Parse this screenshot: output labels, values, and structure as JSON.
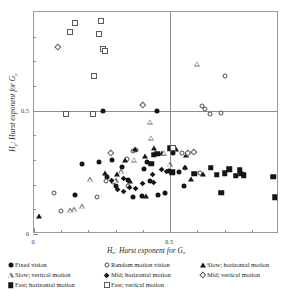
{
  "chart": {
    "type": "scatter",
    "title": "",
    "xlabel": "H_x: Hurst exponent for G_x",
    "xlabel_parts": {
      "sym": "H",
      "sub1": "x",
      "mid": ": Hurst exponent for ",
      "sym2": "G",
      "sub2": "x"
    },
    "ylabel": "H_y: Hurst exponent for G_y",
    "ylabel_parts": {
      "sym": "H",
      "sub1": "y",
      "mid": ": Hurst exponent for ",
      "sym2": "G",
      "sub2": "y"
    },
    "xlim": [
      0,
      0.9
    ],
    "ylim": [
      0,
      0.9
    ],
    "xticks_labeled": [
      {
        "value": 0,
        "label": "0"
      },
      {
        "value": 0.5,
        "label": "0.5"
      }
    ],
    "yticks_labeled": [
      {
        "value": 0,
        "label": "0"
      },
      {
        "value": 0.5,
        "label": "0.5"
      }
    ],
    "xticks_minor": [
      0.1,
      0.2,
      0.3,
      0.4,
      0.6,
      0.7,
      0.8
    ],
    "yticks_minor": [
      0.1,
      0.2,
      0.3,
      0.4,
      0.6,
      0.7,
      0.8
    ],
    "gridlines": {
      "x": [
        0.5
      ],
      "y": [
        0.5
      ]
    },
    "grid": "reference-lines-at-0.5-only",
    "legend_position": "below-axes",
    "frame": true
  },
  "chart_data": {
    "type": "scatter",
    "title": "",
    "xlabel": "Hx: Hurst exponent for Gx",
    "ylabel": "Hy: Hurst exponent for Gy",
    "xlim": [
      0,
      0.9
    ],
    "ylim": [
      0,
      0.9
    ],
    "series": [
      {
        "name": "Fixed vision",
        "marker": "circle-filled",
        "color": "#151515",
        "points": [
          [
            0.255,
            0.5
          ],
          [
            0.45,
            0.498
          ],
          [
            0.175,
            0.285
          ],
          [
            0.237,
            0.29
          ],
          [
            0.285,
            0.3
          ],
          [
            0.322,
            0.272
          ],
          [
            0.268,
            0.232
          ],
          [
            0.3,
            0.195
          ],
          [
            0.345,
            0.218
          ],
          [
            0.403,
            0.262
          ],
          [
            0.415,
            0.292
          ],
          [
            0.425,
            0.213
          ],
          [
            0.48,
            0.168
          ],
          [
            0.512,
            0.327
          ],
          [
            0.552,
            0.195
          ],
          [
            0.497,
            0.255
          ],
          [
            0.152,
            0.16
          ],
          [
            0.395,
            0.155
          ],
          [
            0.362,
            0.152
          ],
          [
            0.532,
            0.25
          ],
          [
            0.455,
            0.158
          ]
        ]
      },
      {
        "name": "Random motion vision",
        "marker": "circle-open",
        "color": "#4a4a4a",
        "points": [
          [
            0.616,
            0.52
          ],
          [
            0.628,
            0.505
          ],
          [
            0.648,
            0.487
          ],
          [
            0.688,
            0.49
          ],
          [
            0.7,
            0.64
          ],
          [
            0.362,
            0.338
          ],
          [
            0.375,
            0.34
          ],
          [
            0.34,
            0.305
          ],
          [
            0.545,
            0.33
          ],
          [
            0.556,
            0.268
          ],
          [
            0.608,
            0.247
          ],
          [
            0.073,
            0.167
          ],
          [
            0.098,
            0.095
          ],
          [
            0.265,
            0.215
          ],
          [
            0.292,
            0.21
          ],
          [
            0.345,
            0.195
          ],
          [
            0.232,
            0.152
          ]
        ]
      },
      {
        "name": "Slow; horizontal motion",
        "marker": "triangle-filled",
        "color": "#151515",
        "points": [
          [
            0.262,
            0.248
          ],
          [
            0.305,
            0.245
          ],
          [
            0.335,
            0.3
          ],
          [
            0.352,
            0.213
          ],
          [
            0.372,
            0.345
          ],
          [
            0.408,
            0.318
          ],
          [
            0.44,
            0.35
          ],
          [
            0.47,
            0.33
          ],
          [
            0.52,
            0.345
          ],
          [
            0.555,
            0.27
          ],
          [
            0.56,
            0.32
          ],
          [
            0.575,
            0.225
          ],
          [
            0.622,
            0.245
          ],
          [
            0.41,
            0.155
          ],
          [
            0.018,
            0.072
          ]
        ]
      },
      {
        "name": "Slow; vertical motion",
        "marker": "triangle-open",
        "color": "#6a6a6a",
        "points": [
          [
            0.6,
            0.69
          ],
          [
            0.425,
            0.455
          ],
          [
            0.43,
            0.39
          ],
          [
            0.478,
            0.33
          ],
          [
            0.368,
            0.302
          ],
          [
            0.32,
            0.255
          ],
          [
            0.3,
            0.217
          ],
          [
            0.498,
            0.282
          ],
          [
            0.205,
            0.222
          ],
          [
            0.178,
            0.112
          ],
          [
            0.148,
            0.1
          ],
          [
            0.132,
            0.097
          ]
        ]
      },
      {
        "name": "Mid; horizontal motion",
        "marker": "diamond-filled",
        "color": "#151515",
        "points": [
          [
            0.352,
            0.19
          ],
          [
            0.328,
            0.173
          ],
          [
            0.308,
            0.18
          ],
          [
            0.372,
            0.185
          ],
          [
            0.4,
            0.205
          ],
          [
            0.438,
            0.207
          ],
          [
            0.435,
            0.24
          ],
          [
            0.47,
            0.262
          ],
          [
            0.488,
            0.255
          ],
          [
            0.33,
            0.225
          ],
          [
            0.285,
            0.215
          ]
        ]
      },
      {
        "name": "Mid; vertical motion",
        "marker": "diamond-open",
        "color": "#5a5a5a",
        "points": [
          [
            0.088,
            0.76
          ],
          [
            0.398,
            0.525
          ],
          [
            0.282,
            0.33
          ],
          [
            0.565,
            0.33
          ],
          [
            0.588,
            0.332
          ]
        ]
      },
      {
        "name": "Fast; horizontal motion",
        "marker": "square-filled",
        "color": "#151515",
        "points": [
          [
            0.43,
            0.285
          ],
          [
            0.44,
            0.322
          ],
          [
            0.452,
            0.325
          ],
          [
            0.508,
            0.25
          ],
          [
            0.588,
            0.245
          ],
          [
            0.65,
            0.268
          ],
          [
            0.672,
            0.24
          ],
          [
            0.7,
            0.247
          ],
          [
            0.718,
            0.262
          ],
          [
            0.742,
            0.237
          ],
          [
            0.755,
            0.258
          ],
          [
            0.76,
            0.245
          ],
          [
            0.77,
            0.238
          ],
          [
            0.688,
            0.168
          ],
          [
            0.878,
            0.233
          ],
          [
            0.885,
            0.15
          ],
          [
            0.5,
            0.347
          ]
        ]
      },
      {
        "name": "Fast; vertical motion",
        "marker": "square-open",
        "color": "#5a5a5a",
        "points": [
          [
            0.152,
            0.855
          ],
          [
            0.133,
            0.82
          ],
          [
            0.245,
            0.862
          ],
          [
            0.238,
            0.81
          ],
          [
            0.252,
            0.748
          ],
          [
            0.262,
            0.74
          ],
          [
            0.222,
            0.64
          ],
          [
            0.118,
            0.487
          ],
          [
            0.218,
            0.487
          ],
          [
            0.512,
            0.35
          ]
        ]
      }
    ]
  },
  "legend": {
    "rows": [
      [
        {
          "label": "Fixed vision",
          "marker": "circle-filled"
        },
        {
          "label": "Random motion vision",
          "marker": "circle-open"
        },
        {
          "label": "Slow; horizontal motion",
          "marker": "triangle-filled"
        }
      ],
      [
        {
          "label": "Slow; vertical motion",
          "marker": "triangle-open"
        },
        {
          "label": "Mid; horizontal motion",
          "marker": "diamond-filled"
        },
        {
          "label": "Mid; vertical motion",
          "marker": "diamond-open"
        }
      ],
      [
        {
          "label": "Fast; horizontal motion",
          "marker": "square-filled"
        },
        {
          "label": "Fast; vertical motion",
          "marker": "square-open"
        }
      ]
    ]
  }
}
